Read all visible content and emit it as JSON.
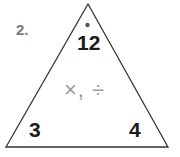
{
  "problem": {
    "number": "2.",
    "top_value": "12",
    "bottom_left_value": "3",
    "bottom_right_value": "4",
    "operations": "×, ÷"
  },
  "colors": {
    "stroke": "#333333",
    "number_label": "#7a7a7a",
    "operations": "#9a9a9a"
  }
}
